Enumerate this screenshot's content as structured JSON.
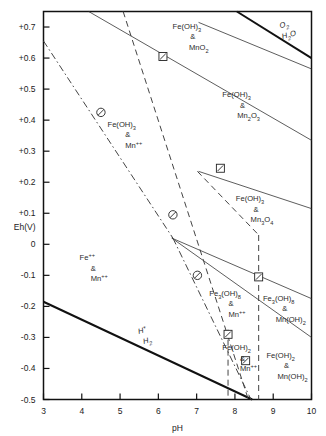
{
  "chart_data": {
    "type": "line",
    "title": "",
    "xlabel": "pH",
    "ylabel": "Eh(V)",
    "xlim": [
      3,
      10
    ],
    "ylim": [
      -0.5,
      0.75
    ],
    "grid": false,
    "legend_position": "none",
    "xticks": [
      "3",
      "4",
      "5",
      "6",
      "7",
      "8",
      "9",
      "10"
    ],
    "xtick_values": [
      3,
      4,
      5,
      6,
      7,
      8,
      9,
      10
    ],
    "yticks": [
      "+0.7",
      "+0.6",
      "+0.5",
      "+0.4",
      "+0.3",
      "+0.2",
      "+0.1",
      "0",
      "-0.1",
      "-0.2",
      "-0.3",
      "-0.4",
      "-0.5"
    ],
    "ytick_values": [
      0.7,
      0.6,
      0.5,
      0.4,
      0.3,
      0.2,
      0.1,
      0,
      -0.1,
      -0.2,
      -0.3,
      -0.4,
      -0.5
    ],
    "series": [
      {
        "name": "O2/H2O stability boundary",
        "style": "solid-thick",
        "points": [
          [
            8.05,
            0.75
          ],
          [
            10.0,
            0.6
          ]
        ]
      },
      {
        "name": "H+/H2 stability boundary",
        "style": "solid-thick",
        "points": [
          [
            3.0,
            -0.185
          ],
          [
            8.45,
            -0.5
          ]
        ]
      },
      {
        "name": "Fe(OH)3 / Mn oxide upper boundary",
        "style": "solid-thin",
        "points": [
          [
            7.05,
            0.715
          ],
          [
            10.0,
            0.565
          ]
        ]
      },
      {
        "name": "MnO2 / Mn2O3 boundary",
        "style": "solid-thin",
        "points": [
          [
            4.18,
            0.75
          ],
          [
            10.0,
            0.335
          ]
        ]
      },
      {
        "name": "Mn2O3 / Mn3O4 boundary",
        "style": "solid-thin",
        "points": [
          [
            7.05,
            0.235
          ],
          [
            10.0,
            0.115
          ]
        ]
      },
      {
        "name": "Mn3O4 / Mn(OH)2 boundary",
        "style": "solid-thin",
        "points": [
          [
            6.35,
            0.02
          ],
          [
            10.0,
            -0.175
          ]
        ]
      },
      {
        "name": "Mn(OH)2 lower boundary",
        "style": "solid-thin",
        "points": [
          [
            6.35,
            0.02
          ],
          [
            10.0,
            -0.3
          ]
        ]
      },
      {
        "name": "Fe(OH)3 / Fe++ boundary (dashed)",
        "style": "dashed",
        "points": [
          [
            5.08,
            0.75
          ],
          [
            8.35,
            -0.5
          ]
        ]
      },
      {
        "name": "Fe3(OH)8 / Fe(OH)2 boundary (dashed)",
        "style": "dashed",
        "points": [
          [
            8.62,
            0.03
          ],
          [
            8.62,
            -0.5
          ]
        ]
      },
      {
        "name": "Fe(OH)3 / Fe3(OH)8 boundary (dashed)",
        "style": "dashed",
        "points": [
          [
            7.02,
            0.235
          ],
          [
            8.62,
            0.03
          ]
        ]
      },
      {
        "name": "Fe(OH)2 left boundary (dashed)",
        "style": "dashed",
        "points": [
          [
            7.82,
            -0.275
          ],
          [
            7.82,
            -0.5
          ]
        ]
      },
      {
        "name": "Mn++ / Mn oxide boundary (dash-dot)",
        "style": "dashdot",
        "points": [
          [
            3.0,
            0.655
          ],
          [
            6.38,
            0.02
          ]
        ]
      },
      {
        "name": "Mn++ lower boundary (dash-dot)",
        "style": "dashdot",
        "points": [
          [
            6.38,
            0.02
          ],
          [
            8.42,
            -0.5
          ]
        ]
      }
    ],
    "markers": [
      {
        "symbol": "circle-slash",
        "x": 4.5,
        "y": 0.425
      },
      {
        "symbol": "circle-slash",
        "x": 6.38,
        "y": 0.095
      },
      {
        "symbol": "circle-slash",
        "x": 7.02,
        "y": -0.1
      },
      {
        "symbol": "square-slash",
        "x": 6.12,
        "y": 0.605
      },
      {
        "symbol": "square-slash",
        "x": 7.62,
        "y": 0.245
      },
      {
        "symbol": "square-slash",
        "x": 8.62,
        "y": -0.105
      },
      {
        "symbol": "square-slash",
        "x": 7.82,
        "y": -0.29
      },
      {
        "symbol": "square-slash",
        "x": 8.28,
        "y": -0.375
      }
    ],
    "region_labels": [
      {
        "text": "Fe(OH)3 & MnO2",
        "x": 6.9,
        "y": 0.66
      },
      {
        "text": "Fe(OH)3 & Mn2O3",
        "x": 8.2,
        "y": 0.44
      },
      {
        "text": "Fe(OH)3 & Mn3O4",
        "x": 8.55,
        "y": 0.105
      },
      {
        "text": "Fe(OH)3 & Mn++",
        "x": 5.2,
        "y": 0.345
      },
      {
        "text": "Fe++ & Mn++",
        "x": 4.3,
        "y": -0.085
      },
      {
        "text": "Fe3(OH)8 & Mn++",
        "x": 7.9,
        "y": -0.2
      },
      {
        "text": "Fe3(OH)8 & Mn(OH)2",
        "x": 9.3,
        "y": -0.215
      },
      {
        "text": "Fe(OH)2 & Mn++",
        "x": 8.2,
        "y": -0.375
      },
      {
        "text": "Fe(OH)2 & Mn(OH)2",
        "x": 9.35,
        "y": -0.4
      }
    ],
    "line_labels": [
      {
        "text": "O2 / H2O",
        "x": 9.3,
        "y": 0.7
      },
      {
        "text": "H+ / H2",
        "x": 5.6,
        "y": -0.285
      }
    ]
  },
  "axes": {
    "x_title": "pH",
    "y_title": "Eh(V)",
    "x_tick_labels": [
      "3",
      "4",
      "5",
      "6",
      "7",
      "8",
      "9",
      "10"
    ],
    "y_tick_labels": [
      "+0.7",
      "+0.6",
      "+0.5",
      "+0.4",
      "+0.3",
      "+0.2",
      "+0.1",
      "0",
      "-0.1",
      "-0.2",
      "-0.3",
      "-0.4",
      "-0.5"
    ]
  },
  "formulas": {
    "fe_oh3": "Fe(OH)",
    "fe_oh3_sub": "3",
    "fe_oh2": "Fe(OH)",
    "fe_oh2_sub": "2",
    "fe3_oh8": "Fe",
    "fe3_oh8_sub1": "3",
    "fe3_oh8_mid": "(OH)",
    "fe3_oh8_sub2": "8",
    "mno2": "MnO",
    "mno2_sub": "2",
    "mn2o3": "Mn",
    "mn2o3_sub1": "2",
    "mn2o3_mid": "O",
    "mn2o3_sub2": "3",
    "mn3o4": "Mn",
    "mn3o4_sub1": "3",
    "mn3o4_mid": "O",
    "mn3o4_sub2": "4",
    "mn_oh2": "Mn(OH)",
    "mn_oh2_sub": "2",
    "mn_ion": "Mn",
    "mn_ion_sup": "++",
    "fe_ion": "Fe",
    "fe_ion_sup": "++",
    "ampersand": "&",
    "o2": "O",
    "o2_sub": "2",
    "h2o": "H",
    "h2o_sub": "2",
    "h2o_tail": "O",
    "h_plus": "H",
    "h_plus_sup": "+",
    "h2": "H",
    "h2_sub": "2"
  },
  "colors": {
    "axis": "#111111",
    "solid_thick": "#111111",
    "solid_thin": "#333333",
    "dashed": "#444444",
    "dashdot": "#444444",
    "text": "#222222",
    "background": "#ffffff"
  }
}
